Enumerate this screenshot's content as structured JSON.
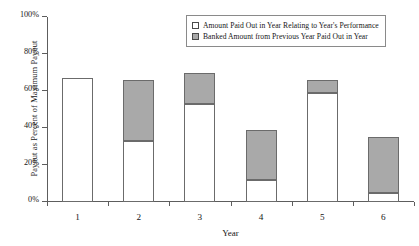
{
  "chart_data": {
    "type": "bar",
    "title": "",
    "subtitle": "",
    "xlabel": "Year",
    "ylabel": "Payout as Percent of Maximum Payout",
    "categories": [
      "1",
      "2",
      "3",
      "4",
      "5",
      "6"
    ],
    "ylim": [
      0,
      100
    ],
    "ytick_labels": [
      "0%",
      "20%",
      "40%",
      "60%",
      "80%",
      "100%"
    ],
    "ytick_values": [
      0,
      20,
      40,
      60,
      80,
      100
    ],
    "grid": false,
    "stacked": true,
    "legend_position": "top-right-inside",
    "series": [
      {
        "name": "Amount Paid Out in Year Relating to Year's Performance",
        "color": "#ffffff",
        "values": [
          67,
          33,
          53,
          12,
          59,
          5
        ]
      },
      {
        "name": "Banked Amount from Previous Year Paid Out in Year",
        "color": "#a9a9a9",
        "values": [
          0,
          33,
          17,
          27,
          7,
          30
        ]
      }
    ],
    "totals": [
      67,
      66,
      70,
      39,
      66,
      35
    ]
  },
  "legend": {
    "items": [
      {
        "label": "Amount Paid Out in Year Relating to Year's Performance",
        "swatch": "paid"
      },
      {
        "label": "Banked Amount from Previous Year Paid Out in Year",
        "swatch": "banked"
      }
    ]
  },
  "artifacts": {
    "top_cropped_text": ""
  }
}
